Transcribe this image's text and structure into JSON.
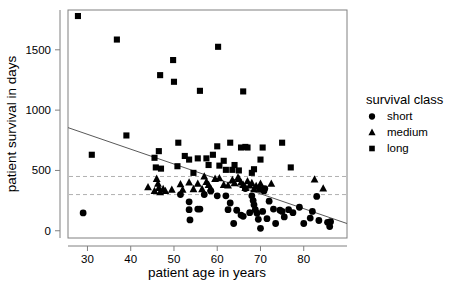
{
  "chart_data": {
    "type": "scatter",
    "title": "",
    "xlabel": "patient age in years",
    "ylabel": "patient survival in days",
    "xlim": [
      25.5,
      90
    ],
    "ylim": [
      -60,
      1830
    ],
    "xticks": [
      30,
      40,
      50,
      60,
      70,
      80
    ],
    "yticks": [
      0,
      500,
      1000,
      1500
    ],
    "grid": false,
    "legend": {
      "title": "survival class",
      "position": "right",
      "entries": [
        {
          "label": "short",
          "marker": "circle"
        },
        {
          "label": "medium",
          "marker": "triangle"
        },
        {
          "label": "long",
          "marker": "square"
        }
      ]
    },
    "annotations": {
      "threshold_lines": [
        {
          "y": 450,
          "style": "dashed",
          "color": "#b0b0b0"
        },
        {
          "y": 300,
          "style": "dashed",
          "color": "#b0b0b0"
        }
      ],
      "regression_line": {
        "style": "solid",
        "color": "#595959",
        "x_start": 25.5,
        "y_start": 855,
        "x_end": 90,
        "y_end": 60
      }
    },
    "series": [
      {
        "name": "short",
        "marker": "circle",
        "points": [
          [
            29.0,
            148
          ],
          [
            51.5,
            300
          ],
          [
            53.5,
            240
          ],
          [
            53.5,
            175
          ],
          [
            53.7,
            90
          ],
          [
            56.0,
            180
          ],
          [
            57.0,
            300
          ],
          [
            58.5,
            330
          ],
          [
            60.0,
            290
          ],
          [
            62.5,
            175
          ],
          [
            63.0,
            230
          ],
          [
            63.8,
            60
          ],
          [
            64.5,
            170
          ],
          [
            65.5,
            130
          ],
          [
            66.0,
            120
          ],
          [
            67.5,
            150
          ],
          [
            68.0,
            290
          ],
          [
            68.3,
            250
          ],
          [
            68.5,
            215
          ],
          [
            68.8,
            175
          ],
          [
            69.2,
            145
          ],
          [
            69.5,
            95
          ],
          [
            70.0,
            20
          ],
          [
            70.5,
            160
          ],
          [
            70.8,
            330
          ],
          [
            71.0,
            350
          ],
          [
            71.5,
            100
          ],
          [
            72.0,
            245
          ],
          [
            73.0,
            180
          ],
          [
            73.5,
            60
          ],
          [
            74.5,
            170
          ],
          [
            75.0,
            160
          ],
          [
            75.5,
            115
          ],
          [
            76.5,
            175
          ],
          [
            77.5,
            150
          ],
          [
            79.0,
            195
          ],
          [
            80.0,
            60
          ],
          [
            81.5,
            105
          ],
          [
            82.0,
            160
          ],
          [
            83.0,
            285
          ],
          [
            83.5,
            85
          ],
          [
            85.5,
            70
          ],
          [
            86.0,
            35
          ],
          [
            86.2,
            75
          ],
          [
            55.5,
            180
          ],
          [
            62.0,
            290
          ],
          [
            66.5,
            350
          ],
          [
            69.8,
            345
          ]
        ]
      },
      {
        "name": "medium",
        "marker": "triangle",
        "points": [
          [
            44.0,
            360
          ],
          [
            45.5,
            330
          ],
          [
            46.0,
            430
          ],
          [
            46.3,
            390
          ],
          [
            46.5,
            355
          ],
          [
            46.8,
            320
          ],
          [
            47.5,
            345
          ],
          [
            48.0,
            330
          ],
          [
            51.5,
            385
          ],
          [
            52.0,
            340
          ],
          [
            53.5,
            400
          ],
          [
            54.5,
            345
          ],
          [
            55.5,
            390
          ],
          [
            56.5,
            345
          ],
          [
            57.0,
            450
          ],
          [
            57.5,
            405
          ],
          [
            58.0,
            380
          ],
          [
            58.5,
            350
          ],
          [
            59.5,
            430
          ],
          [
            60.5,
            435
          ],
          [
            61.5,
            380
          ],
          [
            62.5,
            375
          ],
          [
            63.5,
            420
          ],
          [
            64.0,
            395
          ],
          [
            65.0,
            430
          ],
          [
            65.5,
            400
          ],
          [
            66.0,
            380
          ],
          [
            66.5,
            355
          ],
          [
            67.0,
            410
          ],
          [
            67.5,
            375
          ],
          [
            68.0,
            395
          ],
          [
            68.5,
            345
          ],
          [
            69.0,
            370
          ],
          [
            70.0,
            390
          ],
          [
            70.5,
            345
          ],
          [
            72.5,
            390
          ],
          [
            82.5,
            425
          ],
          [
            84.5,
            350
          ],
          [
            49.5,
            340
          ],
          [
            64.8,
            440
          ]
        ]
      },
      {
        "name": "long",
        "marker": "square",
        "points": [
          [
            27.8,
            1780
          ],
          [
            31.0,
            630
          ],
          [
            36.8,
            1585
          ],
          [
            39.0,
            790
          ],
          [
            45.5,
            605
          ],
          [
            45.8,
            525
          ],
          [
            46.5,
            660
          ],
          [
            46.8,
            1290
          ],
          [
            47.0,
            515
          ],
          [
            49.8,
            1415
          ],
          [
            50.0,
            1235
          ],
          [
            50.8,
            535
          ],
          [
            51.0,
            730
          ],
          [
            52.5,
            620
          ],
          [
            53.5,
            590
          ],
          [
            55.5,
            600
          ],
          [
            56.0,
            1160
          ],
          [
            57.5,
            600
          ],
          [
            58.0,
            545
          ],
          [
            59.0,
            630
          ],
          [
            60.0,
            700
          ],
          [
            60.2,
            1525
          ],
          [
            60.5,
            540
          ],
          [
            61.5,
            580
          ],
          [
            63.0,
            730
          ],
          [
            63.5,
            505
          ],
          [
            65.0,
            500
          ],
          [
            65.5,
            690
          ],
          [
            66.0,
            1155
          ],
          [
            66.5,
            695
          ],
          [
            67.0,
            690
          ],
          [
            68.0,
            480
          ],
          [
            68.5,
            510
          ],
          [
            70.0,
            590
          ],
          [
            70.5,
            690
          ],
          [
            75.0,
            730
          ],
          [
            77.0,
            525
          ],
          [
            54.5,
            480
          ],
          [
            64.0,
            545
          ],
          [
            62.0,
            505
          ]
        ]
      }
    ]
  }
}
